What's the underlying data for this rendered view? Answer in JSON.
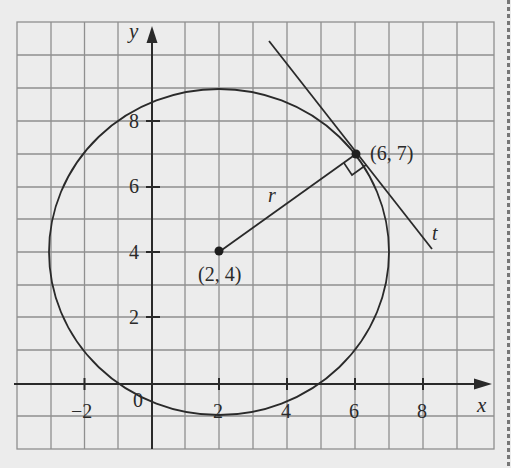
{
  "diagram": {
    "type": "circle-with-tangent",
    "axes": {
      "x_label": "x",
      "y_label": "y",
      "origin_label": "0",
      "x_ticks": [
        {
          "value": -2,
          "label": "−2"
        },
        {
          "value": 2,
          "label": "2"
        },
        {
          "value": 4,
          "label": "4"
        },
        {
          "value": 6,
          "label": "6"
        },
        {
          "value": 8,
          "label": "8"
        }
      ],
      "y_ticks": [
        {
          "value": 2,
          "label": "2"
        },
        {
          "value": 4,
          "label": "4"
        },
        {
          "value": 6,
          "label": "6"
        },
        {
          "value": 8,
          "label": "8"
        }
      ],
      "x_range": [
        -4,
        10
      ],
      "y_range": [
        -2,
        11
      ],
      "grid": true
    },
    "circle": {
      "center": [
        2,
        4
      ],
      "radius": 5
    },
    "points": [
      {
        "name": "center",
        "coords": [
          2,
          4
        ],
        "label": "(2, 4)"
      },
      {
        "name": "point-of-tangency",
        "coords": [
          6,
          7
        ],
        "label": "(6, 7)"
      }
    ],
    "radius_label": "r",
    "tangent_label": "t",
    "right_angle_marker": true,
    "colors": {
      "grid": "#8a8a8a",
      "ink": "#2a2a2a",
      "background": "#ececec"
    }
  }
}
